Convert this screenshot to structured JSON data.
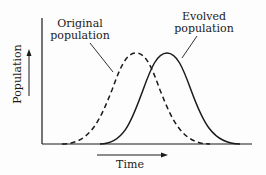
{
  "diagram": {
    "type": "population distribution shift",
    "y_axis": {
      "label": "Population",
      "arrow_direction": "up"
    },
    "x_axis": {
      "label": "Time",
      "arrow_direction": "right"
    },
    "curves": [
      {
        "id": "original",
        "label_line1": "Original",
        "label_line2": "population",
        "style": "dashed",
        "color": "#1a1a1a",
        "peak_x": 136
      },
      {
        "id": "evolved",
        "label_line1": "Evolved",
        "label_line2": "population",
        "style": "solid",
        "color": "#1a1a1a",
        "peak_x": 167
      }
    ]
  }
}
